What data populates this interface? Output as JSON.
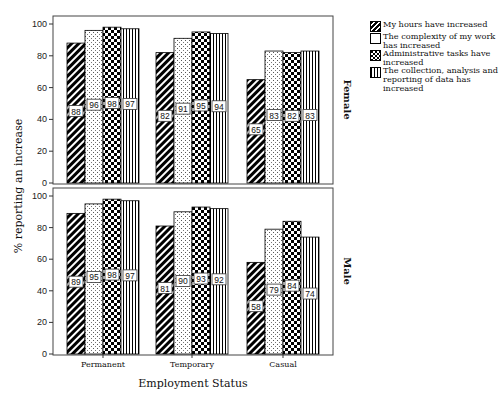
{
  "chart_data": {
    "type": "bar",
    "title": "",
    "xlabel": "Employment Status",
    "ylabel": "% reporting an increase",
    "ylim": [
      0,
      100
    ],
    "yticks": [
      0,
      20,
      40,
      60,
      80,
      100
    ],
    "categories": [
      "Permanent",
      "Temporary",
      "Casual"
    ],
    "legend_position": "right",
    "grid": false,
    "panels": [
      {
        "name": "Female",
        "series": [
          {
            "name": "My hours have increased",
            "values": [
              88,
              82,
              65
            ]
          },
          {
            "name": "The complexity of my work has increased",
            "values": [
              96,
              91,
              83
            ]
          },
          {
            "name": "Administrative tasks have increased",
            "values": [
              98,
              95,
              82
            ]
          },
          {
            "name": "The collection, analysis and reporting of data has increased",
            "values": [
              97,
              94,
              83
            ]
          }
        ]
      },
      {
        "name": "Male",
        "series": [
          {
            "name": "My hours have increased",
            "values": [
              89,
              81,
              58
            ]
          },
          {
            "name": "The complexity of my work has increased",
            "values": [
              95,
              90,
              79
            ]
          },
          {
            "name": "Administrative tasks have increased",
            "values": [
              98,
              93,
              84
            ]
          },
          {
            "name": "The collection, analysis and reporting of data has increased",
            "values": [
              97,
              92,
              74
            ]
          }
        ]
      }
    ]
  },
  "legend": {
    "items": [
      {
        "label": "My hours have increased",
        "pattern": "diagonal"
      },
      {
        "label": "The complexity of my work has increased",
        "pattern": "dots"
      },
      {
        "label": "Administrative tasks have increased",
        "pattern": "checker"
      },
      {
        "label": "The collection, analysis and reporting of data has increased",
        "pattern": "vertical"
      }
    ]
  },
  "colors": {
    "ink": "#000000",
    "background": "#ffffff"
  }
}
